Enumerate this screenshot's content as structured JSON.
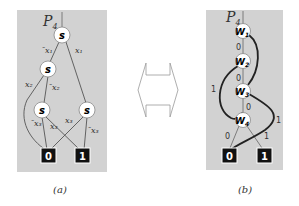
{
  "colors": {
    "panel_bg": "#d2d2d2",
    "node_fill": "#ffffff",
    "edge_thin": "#555555",
    "edge_bold": "#222222",
    "terminal_fill": "#111111",
    "terminal_text": "#ffffff"
  },
  "panel_a": {
    "title": "P",
    "title_sub": "4",
    "nodes": [
      "s",
      "s",
      "s",
      "s"
    ],
    "edge_labels": {
      "root_left": "¯x₁",
      "root_right": "x₁",
      "n2_left": "x₂",
      "n2_right": "¯x₂",
      "n3_left": "¯x₃",
      "n3_right": "x₃",
      "n4_left": "x₃",
      "n4_right": "¯x₃"
    },
    "terminals": [
      "0",
      "1"
    ],
    "caption": "(a)"
  },
  "panel_b": {
    "title": "P",
    "title_sub": "4",
    "nodes": [
      {
        "label": "W",
        "sub": "1"
      },
      {
        "label": "W",
        "sub": "2"
      },
      {
        "label": "W",
        "sub": "3"
      },
      {
        "label": "W",
        "sub": "4"
      }
    ],
    "edge_labels": {
      "w1_w2": "0",
      "w2_w3": "0",
      "w2_left": "1",
      "w3_w4": "0",
      "w3_right": "1",
      "w4_left": "0",
      "w4_right": "1"
    },
    "terminals": [
      "0",
      "1"
    ],
    "caption": "(b)"
  },
  "arrow": {
    "type": "double-headed-outline-arrow",
    "direction": "horizontal"
  }
}
